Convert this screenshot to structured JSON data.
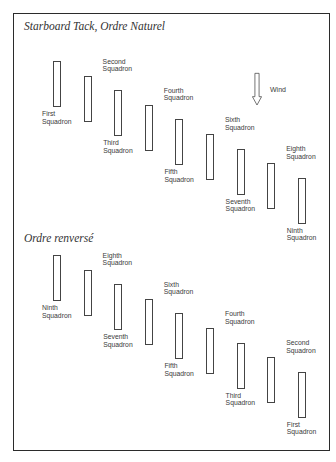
{
  "diagrams": [
    {
      "title": "Starboard Tack, Ordre Naturel",
      "squadrons": [
        {
          "line1": "First",
          "line2": "Squadron",
          "label_position": "below"
        },
        {
          "line1": "Second",
          "line2": "Squadron",
          "label_position": "above"
        },
        {
          "line1": "Third",
          "line2": "Squadron",
          "label_position": "below"
        },
        {
          "line1": "Fourth",
          "line2": "Squadron",
          "label_position": "above"
        },
        {
          "line1": "Fifth",
          "line2": "Squadron",
          "label_position": "below"
        },
        {
          "line1": "Sixth",
          "line2": "Squadron",
          "label_position": "above"
        },
        {
          "line1": "Seventh",
          "line2": "Squadron",
          "label_position": "below"
        },
        {
          "line1": "Eighth",
          "line2": "Squadron",
          "label_position": "above"
        },
        {
          "line1": "Ninth",
          "line2": "Squadron",
          "label_position": "below"
        }
      ]
    },
    {
      "title": "Ordre renversé",
      "squadrons": [
        {
          "line1": "Ninth",
          "line2": "Squadron",
          "label_position": "below"
        },
        {
          "line1": "Eighth",
          "line2": "Squadron",
          "label_position": "above"
        },
        {
          "line1": "Seventh",
          "line2": "Squadron",
          "label_position": "below"
        },
        {
          "line1": "Sixth",
          "line2": "Squadron",
          "label_position": "above"
        },
        {
          "line1": "Fifth",
          "line2": "Squadron",
          "label_position": "below"
        },
        {
          "line1": "Fourth",
          "line2": "Squadron",
          "label_position": "above"
        },
        {
          "line1": "Third",
          "line2": "Squadron",
          "label_position": "below"
        },
        {
          "line1": "Second",
          "line2": "Squadron",
          "label_position": "above"
        },
        {
          "line1": "First",
          "line2": "Squadron",
          "label_position": "below"
        }
      ]
    }
  ],
  "wind": {
    "label": "Wind",
    "icon": "down-arrow-icon",
    "direction": "down"
  }
}
